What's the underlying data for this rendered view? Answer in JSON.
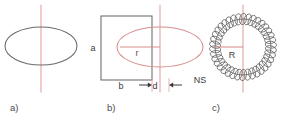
{
  "figure": {
    "width": 284,
    "height": 121,
    "background": "#ffffff"
  },
  "colors": {
    "outline_gray": "#6b6b6b",
    "axis_red": "#e8a0a0",
    "shape_red": "#d98c8c",
    "coil_gray": "#5a5a5a",
    "text_dark": "#3a3a3a",
    "caption_gray": "#4a4a4a",
    "label_red": "#7a4848"
  },
  "panels": [
    {
      "id": "a",
      "caption": "a)",
      "description": "ellipse-with-vertical-axis",
      "caption_x": 10,
      "caption_y": 111,
      "ellipse": {
        "cx": 41,
        "cy": 46,
        "rx": 36,
        "ry": 19
      },
      "axis": {
        "x": 41,
        "y1": 5,
        "y2": 92
      }
    },
    {
      "id": "b",
      "caption": "b)",
      "description": "rectangle-and-ellipse-cross-section",
      "caption_x": 107,
      "caption_y": 111,
      "rect": {
        "x": 101,
        "y": 16,
        "w": 51,
        "h": 64
      },
      "ellipse": {
        "cx": 160,
        "cy": 47,
        "rx": 43,
        "ry": 20
      },
      "axis": {
        "x": 160,
        "y1": 5,
        "y2": 92
      },
      "radius_line": {
        "x1": 120,
        "y1": 47,
        "x2": 160,
        "y2": 47
      },
      "labels": {
        "height": "a",
        "height_x": 93,
        "height_y": 51,
        "width": "b",
        "width_x": 121,
        "width_y": 89,
        "gap": "d",
        "gap_x": 155,
        "gap_y": 89,
        "radius": "r",
        "radius_x": 137,
        "radius_y": 56
      },
      "gap_arrows": {
        "left_tip_x": 152,
        "left_tail_x": 139,
        "right_tip_x": 169,
        "right_tail_x": 182,
        "y": 85
      },
      "gap_ticks": {
        "x1": 152,
        "x2": 169,
        "y1": 78,
        "y2": 92
      }
    },
    {
      "id": "c",
      "caption": "c)",
      "description": "toroidal-coil-winding-top-view",
      "caption_x": 212,
      "caption_y": 111,
      "torus": {
        "cx": 243,
        "cy": 47,
        "r": 28
      },
      "coil": {
        "turns": 38,
        "loop_rx": 3.4,
        "loop_ry": 5.6
      },
      "axis": {
        "x": 243,
        "y1": 5,
        "y2": 92
      },
      "radius_line": {
        "x1": 215,
        "y1": 47,
        "x2": 243,
        "y2": 47
      },
      "labels": {
        "radius": "R",
        "radius_x": 232,
        "radius_y": 58,
        "turns": "NS",
        "turns_x": 200,
        "turns_y": 83
      }
    }
  ]
}
